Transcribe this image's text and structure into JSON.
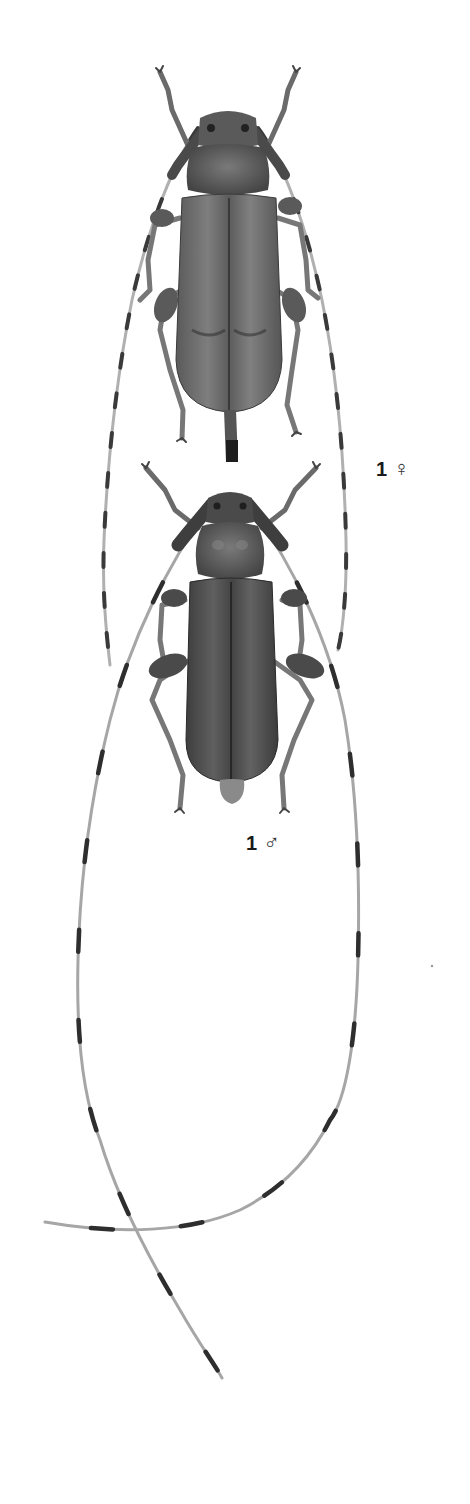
{
  "plate": {
    "specimens": [
      {
        "id": "female",
        "number": "1",
        "sex_symbol": "♀",
        "description": "Longhorn beetle, female, dorsal view, with ovipositor"
      },
      {
        "id": "male",
        "number": "1",
        "sex_symbol": "♂",
        "description": "Longhorn beetle, male, dorsal view, with very long banded antennae"
      }
    ],
    "colors": {
      "background": "#ffffff",
      "body_dark": "#3a3a3a",
      "body_mid": "#5e5e5e",
      "body_light": "#8a8a8a",
      "antenna_light": "#a8a8a8",
      "label": "#1a1a1a"
    }
  }
}
